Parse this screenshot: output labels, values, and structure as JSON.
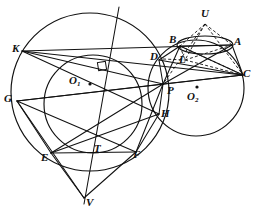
{
  "figure": {
    "type": "geometry-diagram",
    "width": 253,
    "height": 217,
    "background_color": "#ffffff",
    "stroke_color": "#111111"
  },
  "circles": [
    {
      "name": "big-circle-O1",
      "cx": 90,
      "cy": 92,
      "r": 79,
      "style": "solid"
    },
    {
      "name": "small-circle-O2",
      "cx": 196,
      "cy": 88,
      "r": 48,
      "style": "solid"
    },
    {
      "name": "arc-circle-EF-T",
      "cx": 93,
      "cy": 104,
      "r": 49,
      "style": "solid"
    },
    {
      "name": "ellipse-BA-U",
      "cx": 205,
      "cy": 45,
      "rx": 28,
      "ry": 9,
      "style": "solid"
    }
  ],
  "points": {
    "K": {
      "x": 22,
      "y": 51,
      "label": "K",
      "lx": 12,
      "ly": 43
    },
    "G": {
      "x": 17,
      "y": 101,
      "label": "G",
      "lx": 5,
      "ly": 93
    },
    "E": {
      "x": 51,
      "y": 153,
      "label": "E",
      "lx": 42,
      "ly": 152
    },
    "T": {
      "x": 97,
      "y": 147,
      "label": "T",
      "lx": 97,
      "ly": 144
    },
    "F": {
      "x": 136,
      "y": 152,
      "label": "F",
      "lx": 134,
      "ly": 150
    },
    "V": {
      "x": 84,
      "y": 198,
      "label": "V",
      "lx": 86,
      "ly": 197
    },
    "H": {
      "x": 159,
      "y": 114,
      "label": "H",
      "lx": 161,
      "ly": 109
    },
    "P": {
      "x": 163,
      "y": 84,
      "label": "P",
      "lx": 167,
      "ly": 86
    },
    "D": {
      "x": 159,
      "y": 60,
      "label": "D",
      "lx": 152,
      "ly": 52
    },
    "L": {
      "x": 185,
      "y": 60,
      "label": "L",
      "lx": 180,
      "ly": 55
    },
    "B": {
      "x": 180,
      "y": 46,
      "label": "B",
      "lx": 170,
      "ly": 36
    },
    "A": {
      "x": 232,
      "y": 45,
      "label": "A",
      "lx": 235,
      "ly": 38
    },
    "U": {
      "x": 205,
      "y": 24,
      "label": "U",
      "lx": 202,
      "ly": 10
    },
    "C": {
      "x": 243,
      "y": 75,
      "label": "C",
      "lx": 243,
      "ly": 69
    },
    "O1": {
      "x": 90,
      "y": 84,
      "label": "O",
      "sub": "1",
      "lx": 70,
      "ly": 76
    },
    "O2": {
      "x": 197,
      "y": 88,
      "label": "O",
      "sub": "2",
      "lx": 188,
      "ly": 92
    }
  },
  "labels": [
    {
      "name": "label-K",
      "text": "K",
      "sub": "",
      "x": 12,
      "y": 43
    },
    {
      "name": "label-G",
      "text": "G",
      "sub": "",
      "x": 4,
      "y": 93
    },
    {
      "name": "label-E",
      "text": "E",
      "sub": "",
      "x": 41,
      "y": 152
    },
    {
      "name": "label-T",
      "text": "T",
      "sub": "",
      "x": 94,
      "y": 143
    },
    {
      "name": "label-F",
      "text": "F",
      "sub": "",
      "x": 133,
      "y": 149
    },
    {
      "name": "label-V",
      "text": "V",
      "sub": "",
      "x": 86,
      "y": 197
    },
    {
      "name": "label-H",
      "text": "H",
      "sub": "",
      "x": 161,
      "y": 108
    },
    {
      "name": "label-P",
      "text": "P",
      "sub": "",
      "x": 167,
      "y": 85
    },
    {
      "name": "label-D",
      "text": "D",
      "sub": "",
      "x": 150,
      "y": 51
    },
    {
      "name": "label-L",
      "text": "L",
      "sub": "",
      "x": 179,
      "y": 54
    },
    {
      "name": "label-B",
      "text": "B",
      "sub": "",
      "x": 169,
      "y": 34
    },
    {
      "name": "label-A",
      "text": "A",
      "sub": "",
      "x": 234,
      "y": 36
    },
    {
      "name": "label-U",
      "text": "U",
      "sub": "",
      "x": 201,
      "y": 8
    },
    {
      "name": "label-C",
      "text": "C",
      "sub": "",
      "x": 243,
      "y": 68
    },
    {
      "name": "label-O1",
      "text": "O",
      "sub": "1",
      "x": 69,
      "y": 75
    },
    {
      "name": "label-O2",
      "text": "O",
      "sub": "2",
      "x": 187,
      "y": 91
    }
  ],
  "solid_segments": [
    {
      "name": "seg-K-C",
      "x1": 22,
      "y1": 51,
      "x2": 243,
      "y2": 75
    },
    {
      "name": "seg-K-A",
      "x1": 22,
      "y1": 51,
      "x2": 232,
      "y2": 45
    },
    {
      "name": "seg-K-P",
      "x1": 22,
      "y1": 51,
      "x2": 163,
      "y2": 84
    },
    {
      "name": "seg-K-H",
      "x1": 22,
      "y1": 51,
      "x2": 159,
      "y2": 114
    },
    {
      "name": "seg-G-C",
      "x1": 17,
      "y1": 101,
      "x2": 243,
      "y2": 75
    },
    {
      "name": "seg-G-P",
      "x1": 17,
      "y1": 101,
      "x2": 163,
      "y2": 84
    },
    {
      "name": "seg-G-F",
      "x1": 17,
      "y1": 101,
      "x2": 136,
      "y2": 152
    },
    {
      "name": "seg-G-E",
      "x1": 17,
      "y1": 101,
      "x2": 51,
      "y2": 153
    },
    {
      "name": "seg-G-V",
      "x1": 17,
      "y1": 101,
      "x2": 84,
      "y2": 198
    },
    {
      "name": "seg-E-F",
      "x1": 51,
      "y1": 153,
      "x2": 136,
      "y2": 152
    },
    {
      "name": "seg-E-P",
      "x1": 51,
      "y1": 153,
      "x2": 163,
      "y2": 84
    },
    {
      "name": "seg-E-H",
      "x1": 51,
      "y1": 153,
      "x2": 159,
      "y2": 114
    },
    {
      "name": "seg-E-V",
      "x1": 51,
      "y1": 153,
      "x2": 84,
      "y2": 198
    },
    {
      "name": "seg-F-P",
      "x1": 136,
      "y1": 152,
      "x2": 163,
      "y2": 84
    },
    {
      "name": "seg-F-H",
      "x1": 136,
      "y1": 152,
      "x2": 159,
      "y2": 114
    },
    {
      "name": "seg-F-V",
      "x1": 136,
      "y1": 152,
      "x2": 84,
      "y2": 198
    },
    {
      "name": "seg-P-H",
      "x1": 163,
      "y1": 84,
      "x2": 159,
      "y2": 114
    },
    {
      "name": "seg-P-D",
      "x1": 163,
      "y1": 84,
      "x2": 159,
      "y2": 60
    },
    {
      "name": "seg-P-B",
      "x1": 163,
      "y1": 84,
      "x2": 180,
      "y2": 46
    },
    {
      "name": "seg-P-A",
      "x1": 163,
      "y1": 84,
      "x2": 232,
      "y2": 45
    },
    {
      "name": "seg-P-C",
      "x1": 163,
      "y1": 84,
      "x2": 243,
      "y2": 75
    },
    {
      "name": "seg-D-B",
      "x1": 159,
      "y1": 60,
      "x2": 180,
      "y2": 46
    },
    {
      "name": "seg-B-A",
      "x1": 180,
      "y1": 46,
      "x2": 232,
      "y2": 45
    },
    {
      "name": "seg-B-C",
      "x1": 180,
      "y1": 46,
      "x2": 243,
      "y2": 75
    },
    {
      "name": "seg-A-C",
      "x1": 232,
      "y1": 45,
      "x2": 243,
      "y2": 75
    },
    {
      "name": "seg-V-line-up",
      "x1": 84,
      "y1": 204,
      "x2": 119,
      "y2": 7
    },
    {
      "name": "seg-D-C",
      "x1": 159,
      "y1": 60,
      "x2": 243,
      "y2": 75
    }
  ],
  "dashed_segments": [
    {
      "name": "dash-U-B",
      "x1": 205,
      "y1": 24,
      "x2": 180,
      "y2": 46
    },
    {
      "name": "dash-U-A",
      "x1": 205,
      "y1": 24,
      "x2": 232,
      "y2": 45
    },
    {
      "name": "dash-U-L",
      "x1": 205,
      "y1": 24,
      "x2": 185,
      "y2": 60
    },
    {
      "name": "dash-U-C",
      "x1": 205,
      "y1": 24,
      "x2": 243,
      "y2": 75
    },
    {
      "name": "dash-U-P",
      "x1": 205,
      "y1": 24,
      "x2": 163,
      "y2": 84
    },
    {
      "name": "dash-B-L",
      "x1": 180,
      "y1": 46,
      "x2": 185,
      "y2": 60
    },
    {
      "name": "dash-L-A",
      "x1": 185,
      "y1": 60,
      "x2": 232,
      "y2": 45
    },
    {
      "name": "dash-L-C",
      "x1": 185,
      "y1": 60,
      "x2": 243,
      "y2": 75
    },
    {
      "name": "dash-D-L",
      "x1": 163,
      "y1": 59,
      "x2": 185,
      "y2": 60
    },
    {
      "name": "dash-B-Cc",
      "x1": 180,
      "y1": 46,
      "x2": 243,
      "y2": 75
    }
  ],
  "marks": {
    "right_angle": {
      "name": "right-angle-mark",
      "x": 98,
      "y": 62,
      "size": 8,
      "rotation": -9
    },
    "center_dot_O1": {
      "name": "center-dot-O1",
      "x": 90,
      "y": 84,
      "r": 1.6
    },
    "center_dot_O2": {
      "name": "center-dot-O2",
      "x": 197,
      "y": 87,
      "r": 1.6
    }
  }
}
